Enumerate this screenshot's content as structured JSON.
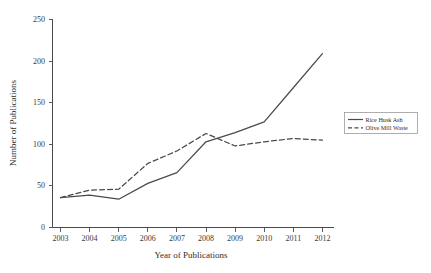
{
  "chart_data": {
    "type": "line",
    "title": "",
    "xlabel": "Year of Publications",
    "ylabel": "Number of Publications",
    "categories": [
      "2003",
      "2004",
      "2005",
      "2006",
      "2007",
      "2008",
      "2009",
      "2010",
      "2011",
      "2012"
    ],
    "x": [
      2003,
      2004,
      2005,
      2006,
      2007,
      2008,
      2009,
      2010,
      2011,
      2012
    ],
    "series": [
      {
        "name": "Rice Husk Ash",
        "style": "solid",
        "color": "#4a4a4a",
        "values": [
          36,
          39,
          34,
          53,
          66,
          103,
          114,
          127,
          168,
          209
        ]
      },
      {
        "name": "Olive Mill Waste",
        "style": "dashed",
        "color": "#4a4a4a",
        "values": [
          36,
          45,
          46,
          77,
          92,
          113,
          98,
          103,
          107,
          105
        ]
      }
    ],
    "ylim": [
      0,
      250
    ],
    "yticks": [
      0,
      50,
      100,
      150,
      200,
      250
    ],
    "ytick_labels": [
      "0",
      "50",
      "100",
      "150",
      "200",
      "250"
    ],
    "xlim": [
      2003,
      2012
    ],
    "grid": false,
    "legend_position": "right-outside"
  },
  "axes": {
    "y_title": "Number of Publications",
    "x_title": "Year of Publications",
    "y_ticks": [
      "250",
      "200",
      "150",
      "100",
      "50",
      "0"
    ],
    "x_ticks": [
      "2003",
      "2004",
      "2005",
      "2006",
      "2007",
      "2008",
      "2009",
      "2010",
      "2011",
      "2012"
    ]
  },
  "legend": {
    "entries": [
      {
        "label": "Rice Husk Ash",
        "style": "solid"
      },
      {
        "label": "Olive Mill Waste",
        "style": "dashed"
      }
    ]
  }
}
